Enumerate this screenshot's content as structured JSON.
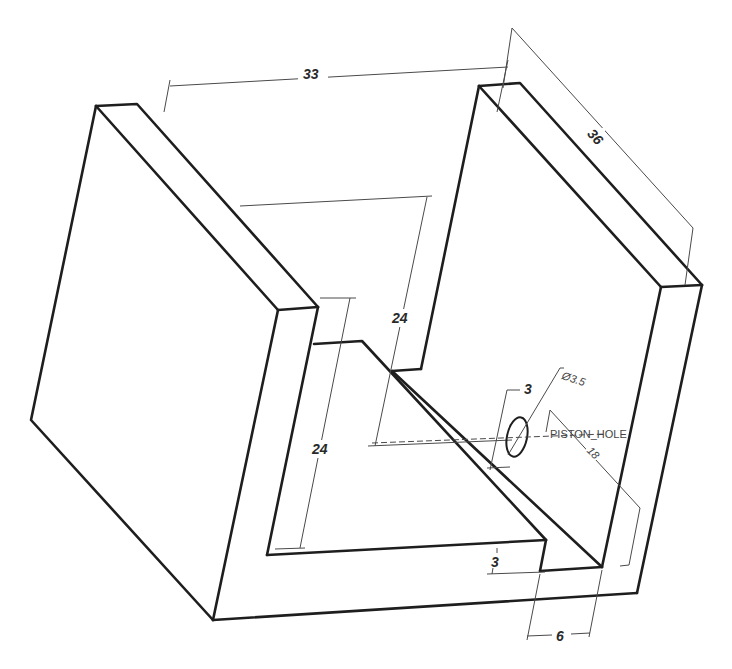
{
  "drawing": {
    "type": "isometric technical drawing",
    "subject": "U-channel bracket with piston hole",
    "dimensions": {
      "overall_width": "33",
      "wall_depth": "36",
      "inner_height_back": "24",
      "inner_height_front": "24",
      "hole_offset": "3",
      "hole_diameter_prefix": "Ø",
      "hole_diameter": "3.5",
      "hole_diameter_label": "Ø3.5",
      "hole_distance": "18",
      "base_thickness": "3",
      "slot_width": "6"
    },
    "labels": {
      "hole_name": "PISTON_HOLE"
    },
    "colors": {
      "line": "#1e1e1e",
      "dimension_line": "#4a4a4a",
      "background": "#ffffff"
    }
  }
}
